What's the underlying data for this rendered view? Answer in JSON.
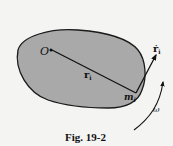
{
  "figure": {
    "caption": "Fig. 19-2",
    "labels": {
      "origin": "O",
      "position_vector": "r",
      "position_subscript": "i",
      "mass": "m",
      "mass_subscript": "i",
      "velocity": "ṙ",
      "velocity_subscript": "i",
      "angular_velocity": "ω"
    },
    "colors": {
      "body_fill": "#a9a9a9",
      "outline": "#1a1a1a",
      "background": "#f4f4f2"
    }
  }
}
